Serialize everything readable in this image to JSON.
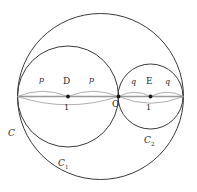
{
  "figure": {
    "type": "geometry-diagram",
    "background": "#ffffff",
    "stroke_dark": "#3a3a3a",
    "stroke_light": "#9a9a9a",
    "text_color": "#2b2b2b",
    "width": 197,
    "height": 192
  },
  "circles": [
    {
      "name": "C",
      "cx": 100.5,
      "cy": 96.5,
      "r": 83.0,
      "stroke": "#3a3a3a",
      "width": 1.0
    },
    {
      "name": "C1",
      "cx": 68.0,
      "cy": 96.5,
      "r": 50.5,
      "stroke": "#3a3a3a",
      "width": 1.0
    },
    {
      "name": "C2",
      "cx": 150.5,
      "cy": 96.5,
      "r": 32.5,
      "stroke": "#3a3a3a",
      "width": 1.0
    }
  ],
  "diameter_line": {
    "x1": 17.5,
    "y1": 96.5,
    "x2": 183.5,
    "y2": 96.5,
    "stroke": "#9a9a9a"
  },
  "lens_arcs": [
    {
      "name": "left-upper-p-left",
      "d": "M 17.5 96.5 Q 42.5 86.0 68.0 96.5"
    },
    {
      "name": "left-upper-p-right",
      "d": "M 68.0 96.5 Q 93.0 86.0 118.5 96.5"
    },
    {
      "name": "left-lower-1",
      "d": "M 17.5 96.5 Q 68.0 113.0 118.5 96.5"
    },
    {
      "name": "right-upper-q-left",
      "d": "M 118.5 96.5 Q 134.5 88.5 150.5 96.5"
    },
    {
      "name": "right-upper-q-right",
      "d": "M 150.5 96.5 Q 167.0 88.5 183.5 96.5"
    },
    {
      "name": "right-lower-1",
      "d": "M 118.5 96.5 Q 150.5 110.0 183.5 96.5"
    }
  ],
  "points": [
    {
      "name": "D",
      "cx": 68.0,
      "cy": 96.5,
      "r": 1.9
    },
    {
      "name": "O",
      "cx": 118.5,
      "cy": 96.5,
      "r": 1.9
    },
    {
      "name": "E",
      "cx": 150.5,
      "cy": 96.5,
      "r": 1.9
    }
  ],
  "labels": {
    "p_left": {
      "text": "p",
      "x": 39,
      "y": 81,
      "size": 8,
      "italic": true
    },
    "p_right": {
      "text": "p",
      "x": 89,
      "y": 81,
      "size": 8,
      "italic": true
    },
    "one_left": {
      "text": "1",
      "x": 64,
      "y": 106,
      "size": 8,
      "italic": false
    },
    "q_left": {
      "text": "q",
      "x": 131,
      "y": 83,
      "size": 8,
      "italic": true
    },
    "q_right": {
      "text": "q",
      "x": 165,
      "y": 83,
      "size": 8,
      "italic": true
    },
    "one_right": {
      "text": "1",
      "x": 146,
      "y": 106,
      "size": 8,
      "italic": false
    },
    "D": {
      "text": "D",
      "x": 63,
      "y": 80,
      "size": 9,
      "italic": false
    },
    "O": {
      "text": "O",
      "x": 113,
      "y": 103,
      "size": 9,
      "italic": false
    },
    "E": {
      "text": "E",
      "x": 146,
      "y": 81,
      "size": 9,
      "italic": false
    },
    "C": {
      "text": "C",
      "x": 8,
      "y": 133,
      "size": 9,
      "italic": true
    },
    "C1": {
      "text": "C",
      "sub": "1",
      "x": 58,
      "y": 163,
      "size": 9,
      "italic": true
    },
    "C2": {
      "text": "C",
      "sub": "2",
      "x": 144,
      "y": 140,
      "size": 9,
      "italic": true
    }
  }
}
